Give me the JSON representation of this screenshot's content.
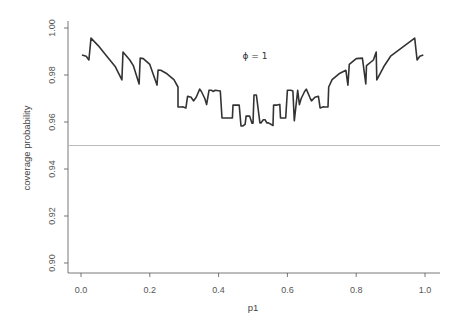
{
  "chart_data": {
    "type": "line",
    "title": "",
    "xlabel": "p1",
    "ylabel": "coverage probability",
    "xlim": [
      0.0,
      1.0
    ],
    "ylim": [
      0.9,
      1.0
    ],
    "xticks": [
      0.0,
      0.2,
      0.4,
      0.6,
      0.8,
      1.0
    ],
    "xtick_labels": [
      "0.0",
      "0.2",
      "0.4",
      "0.6",
      "0.8",
      "1.0"
    ],
    "yticks": [
      0.9,
      0.92,
      0.94,
      0.96,
      0.98,
      1.0
    ],
    "ytick_labels": [
      "0.90",
      "0.92",
      "0.94",
      "0.96",
      "0.98",
      "1.00"
    ],
    "grid": false,
    "annotation": {
      "text": "ϕ = 1",
      "x": 0.5,
      "y": 0.988
    },
    "reference_line": {
      "y": 0.95,
      "color": "#bbbbbb",
      "label": "nominal 0.95"
    },
    "series": [
      {
        "name": "coverage",
        "color": "#333333",
        "x": [
          0.003,
          0.015,
          0.023,
          0.029,
          0.05,
          0.075,
          0.1,
          0.119,
          0.122,
          0.142,
          0.152,
          0.169,
          0.172,
          0.181,
          0.2,
          0.221,
          0.224,
          0.232,
          0.25,
          0.27,
          0.282,
          0.282,
          0.293,
          0.295,
          0.305,
          0.31,
          0.32,
          0.327,
          0.335,
          0.345,
          0.35,
          0.36,
          0.365,
          0.372,
          0.38,
          0.384,
          0.39,
          0.405,
          0.41,
          0.42,
          0.43,
          0.44,
          0.442,
          0.455,
          0.46,
          0.465,
          0.47,
          0.477,
          0.48,
          0.49,
          0.497,
          0.5,
          0.503,
          0.51,
          0.52,
          0.523,
          0.53,
          0.535,
          0.54,
          0.545,
          0.558,
          0.56,
          0.57,
          0.578,
          0.58,
          0.59,
          0.595,
          0.6,
          0.61,
          0.616,
          0.62,
          0.63,
          0.635,
          0.64,
          0.65,
          0.655,
          0.665,
          0.67,
          0.68,
          0.69,
          0.695,
          0.705,
          0.708,
          0.718,
          0.72,
          0.73,
          0.75,
          0.77,
          0.776,
          0.78,
          0.8,
          0.818,
          0.828,
          0.83,
          0.85,
          0.858,
          0.86,
          0.88,
          0.9,
          0.97,
          0.977,
          0.985,
          0.995
        ],
        "y": [
          0.9885,
          0.988,
          0.9864,
          0.9957,
          0.9925,
          0.988,
          0.9835,
          0.9779,
          0.9898,
          0.9864,
          0.984,
          0.9762,
          0.9872,
          0.987,
          0.9845,
          0.9757,
          0.9821,
          0.982,
          0.9805,
          0.978,
          0.9749,
          0.9664,
          0.9664,
          0.9665,
          0.966,
          0.971,
          0.9705,
          0.969,
          0.9705,
          0.974,
          0.973,
          0.97,
          0.9674,
          0.9735,
          0.9735,
          0.973,
          0.9735,
          0.9732,
          0.9617,
          0.9617,
          0.9617,
          0.9617,
          0.9672,
          0.9672,
          0.9672,
          0.9583,
          0.9583,
          0.959,
          0.9625,
          0.9625,
          0.9595,
          0.9595,
          0.9715,
          0.9715,
          0.9596,
          0.9596,
          0.961,
          0.961,
          0.9596,
          0.9596,
          0.9585,
          0.9672,
          0.9672,
          0.9675,
          0.9617,
          0.9617,
          0.9617,
          0.9735,
          0.9735,
          0.9732,
          0.9605,
          0.9735,
          0.9674,
          0.97,
          0.973,
          0.974,
          0.9705,
          0.969,
          0.9705,
          0.971,
          0.966,
          0.9665,
          0.9664,
          0.9664,
          0.9749,
          0.978,
          0.9805,
          0.982,
          0.9757,
          0.9845,
          0.987,
          0.9872,
          0.9762,
          0.984,
          0.9864,
          0.9898,
          0.9779,
          0.9835,
          0.988,
          0.9957,
          0.9864,
          0.988,
          0.9885
        ]
      }
    ]
  }
}
